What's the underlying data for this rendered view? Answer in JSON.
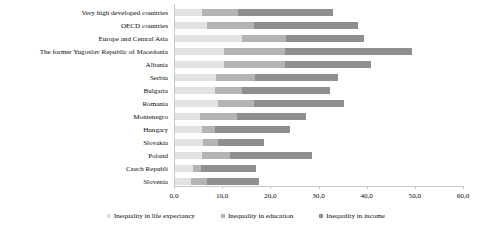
{
  "chart_data": {
    "type": "bar",
    "orientation": "horizontal",
    "stacked": true,
    "title": "",
    "subtitle": "",
    "xlabel": "",
    "ylabel": "",
    "xlim": [
      0,
      60
    ],
    "grid": false,
    "legend_position": "bottom",
    "categories": [
      "Very high developed countries",
      "OECD countries",
      "Europe and Central Asia",
      "The former Yugoslav Republic of Macedonia",
      "Albania",
      "Serbia",
      "Bulgaria",
      "Romania",
      "Montenegro",
      "Hungary",
      "Slovakia",
      "Poland",
      "Czech Republi",
      "Slovenia"
    ],
    "tick_labels": [
      "0,0",
      "10,0",
      "20,0",
      "30,0",
      "40,0",
      "50,0",
      "60,0"
    ],
    "tick_values": [
      0,
      10,
      20,
      30,
      40,
      50,
      60
    ],
    "series": [
      {
        "name": "Inequality in life expectancy",
        "color": "#e2e2e2",
        "values": [
          5.6,
          6.7,
          14.0,
          10.2,
          10.2,
          8.5,
          8.3,
          9.0,
          5.2,
          5.6,
          5.8,
          5.6,
          3.8,
          3.3
        ]
      },
      {
        "name": "Inequality in education",
        "color": "#b4b4b4",
        "values": [
          7.5,
          9.8,
          9.0,
          12.7,
          12.7,
          8.1,
          5.6,
          7.3,
          7.7,
          2.7,
          3.1,
          5.8,
          1.5,
          3.3
        ]
      },
      {
        "name": "Inequality in income",
        "color": "#8f8f8f",
        "values": [
          19.6,
          21.4,
          16.2,
          26.3,
          17.7,
          17.3,
          18.3,
          18.8,
          14.2,
          15.6,
          9.6,
          17.1,
          11.5,
          10.8
        ]
      }
    ],
    "totals": [
      32.7,
      37.9,
      39.2,
      49.2,
      40.6,
      33.9,
      32.2,
      35.1,
      27.1,
      23.9,
      18.5,
      28.5,
      16.8,
      17.4
    ]
  },
  "legend": {
    "items": [
      {
        "label": "Inequality in life expectancy",
        "color": "#e2e2e2"
      },
      {
        "label": "Inequality in education",
        "color": "#b4b4b4"
      },
      {
        "label": "Inequality in income",
        "color": "#8f8f8f"
      }
    ]
  }
}
